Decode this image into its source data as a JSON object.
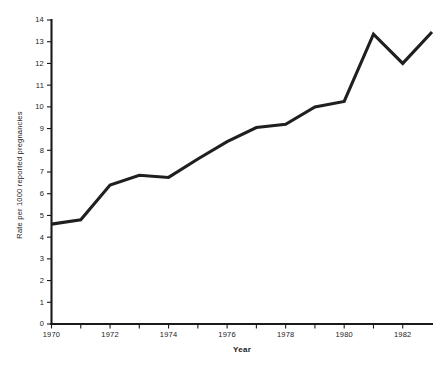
{
  "chart_data": {
    "type": "line",
    "title": "",
    "xlabel": "Year",
    "ylabel": "Rate per 1000 reported pregnancies",
    "xlim": [
      1970,
      1983
    ],
    "ylim": [
      0,
      14
    ],
    "grid": false,
    "legend": null,
    "x_tick_labels": [
      "1970",
      "1972",
      "1974",
      "1976",
      "1978",
      "1980",
      "1982"
    ],
    "x_tick_values": [
      1970,
      1972,
      1974,
      1976,
      1978,
      1980,
      1982
    ],
    "x_minor_ticks": [
      1971,
      1973,
      1975,
      1977,
      1979,
      1981
    ],
    "y_tick_labels": [
      "0",
      "1",
      "2",
      "3",
      "4",
      "5",
      "6",
      "7",
      "8",
      "9",
      "10",
      "11",
      "12",
      "13",
      "14"
    ],
    "y_tick_values": [
      0,
      1,
      2,
      3,
      4,
      5,
      6,
      7,
      8,
      9,
      10,
      11,
      12,
      13,
      14
    ],
    "series": [
      {
        "name": "Ectopic pregnancy rate",
        "color": "#1f1f1f",
        "x": [
          1970,
          1971,
          1972,
          1973,
          1974,
          1975,
          1976,
          1977,
          1978,
          1979,
          1980,
          1981,
          1982,
          1983
        ],
        "values": [
          4.6,
          4.8,
          6.4,
          6.85,
          6.75,
          7.6,
          8.4,
          9.05,
          9.2,
          10.0,
          10.25,
          13.35,
          12.0,
          13.45
        ]
      }
    ]
  },
  "figure": {
    "background_color": "#ffffff",
    "line_color": "#1f1f1f",
    "axis_color": "#1a1a1a"
  }
}
